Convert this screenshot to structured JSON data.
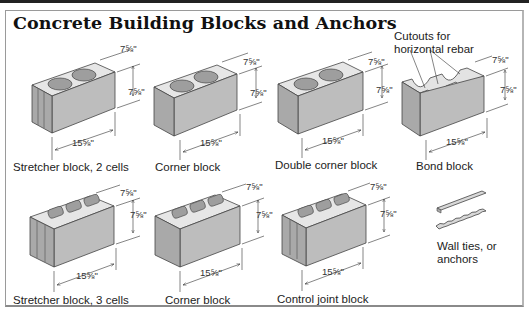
{
  "title": "Concrete Building Blocks and Anchors",
  "dimensions": {
    "width": "7⅝\"",
    "height": "7⅝\"",
    "length": "15⅝\""
  },
  "blocks": [
    {
      "label": "Stretcher block, 2 cells",
      "cells": 2,
      "row": 1
    },
    {
      "label": "Corner block",
      "cells": 2,
      "row": 1
    },
    {
      "label": "Double corner block",
      "cells": 2,
      "row": 1
    },
    {
      "label": "Bond block",
      "cells": 2,
      "row": 1
    },
    {
      "label": "Stretcher block, 3 cells",
      "cells": 3,
      "row": 2
    },
    {
      "label": "Corner block",
      "cells": 3,
      "row": 2
    },
    {
      "label": "Control joint block",
      "cells": 3,
      "row": 2
    }
  ],
  "annotations": {
    "bond_cutouts": "Cutouts for horizontal rebar",
    "bond_cutouts_line1": "Cutouts for",
    "bond_cutouts_line2": "horizontal rebar",
    "wall_ties_line1": "Wall ties, or",
    "wall_ties_line2": "anchors"
  },
  "colors": {
    "block_top": "#e6e6e6",
    "block_front": "#bdbdbd",
    "block_side": "#a8a8a8",
    "title": "#111111"
  }
}
